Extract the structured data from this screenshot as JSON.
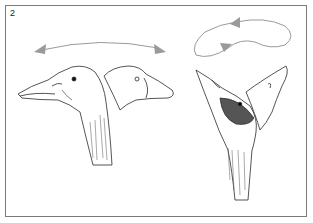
{
  "figure": {
    "panel_label": "2",
    "colors": {
      "border": "#7a7a7a",
      "arrow": "#9a9a9a",
      "ink": "#2a2a2a",
      "background": "#ffffff"
    },
    "left_group": {
      "description": "side-to-side head turning",
      "arrow": "double-headed arc",
      "heads": [
        "head facing left",
        "head facing right (outline)"
      ]
    },
    "right_group": {
      "description": "circular head rolling motion",
      "arrow": "looping closed arrow",
      "heads": [
        "head tilted upward-left",
        "head tilted upward-right (outline)"
      ]
    }
  }
}
